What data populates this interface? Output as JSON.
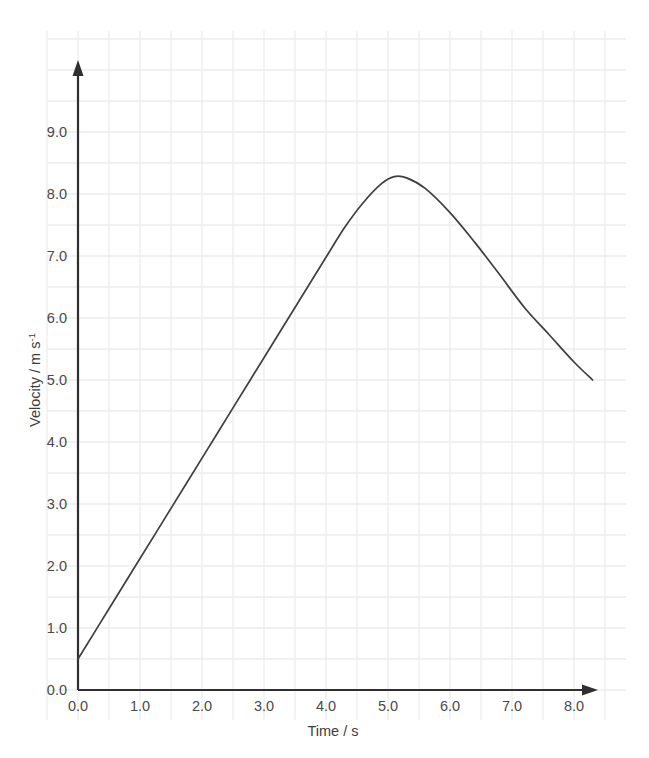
{
  "chart_data": {
    "type": "line",
    "title": "",
    "xlabel": "Time / s",
    "ylabel": "Velocity / m s",
    "ylabel_exponent": "-1",
    "xlim": [
      0.0,
      8.8
    ],
    "ylim": [
      0.0,
      10.2
    ],
    "grid": true,
    "grid_step_x": 0.5,
    "grid_step_y": 0.5,
    "legend": "none",
    "xticks": [
      "0.0",
      "1.0",
      "2.0",
      "3.0",
      "4.0",
      "5.0",
      "6.0",
      "7.0",
      "8.0"
    ],
    "xtick_values": [
      0.0,
      1.0,
      2.0,
      3.0,
      4.0,
      5.0,
      6.0,
      7.0,
      8.0
    ],
    "yticks": [
      "0.0",
      "1.0",
      "2.0",
      "3.0",
      "4.0",
      "5.0",
      "6.0",
      "7.0",
      "8.0",
      "9.0"
    ],
    "ytick_values": [
      0.0,
      1.0,
      2.0,
      3.0,
      4.0,
      5.0,
      6.0,
      7.0,
      8.0,
      9.0
    ],
    "series": [
      {
        "name": "velocity",
        "color": "#3f3f3f",
        "x": [
          0.0,
          0.5,
          1.0,
          1.5,
          2.0,
          2.5,
          3.0,
          3.5,
          4.0,
          4.3,
          4.6,
          4.9,
          5.1,
          5.3,
          5.6,
          6.0,
          6.4,
          6.8,
          7.2,
          7.6,
          8.0,
          8.3
        ],
        "y": [
          0.5,
          1.31,
          2.12,
          2.93,
          3.74,
          4.55,
          5.36,
          6.17,
          6.98,
          7.46,
          7.86,
          8.17,
          8.28,
          8.26,
          8.09,
          7.7,
          7.22,
          6.7,
          6.17,
          5.73,
          5.29,
          5.0
        ]
      }
    ],
    "annotations": {
      "start_point": "(0.0, 0.5)",
      "peak_point": "(5.1, 8.3)",
      "end_point": "(8.3, 5.0)"
    }
  },
  "colors": {
    "grid": "#ededed",
    "axis": "#2f2f2f",
    "curve": "#3f3f3f",
    "background": "#ffffff",
    "tick_text": "#4a4a4a"
  }
}
